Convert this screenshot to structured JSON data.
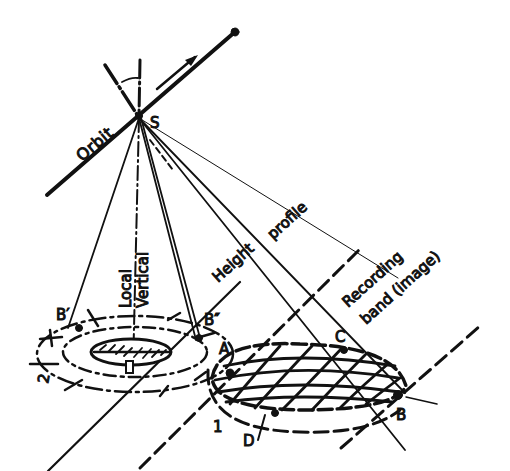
{
  "diagram": {
    "type": "satellite sensor geometry sketch",
    "colors": {
      "ink": "#111111",
      "background": "#ffffff"
    },
    "labels": {
      "orbit": "Orbit",
      "satellite": "S",
      "local_vertical_line1": "Local",
      "local_vertical_line2": "Vertical",
      "height_profile_1": "Height",
      "height_profile_2": "profile",
      "recording_band_1": "Recording",
      "recording_band_2": "band (image)",
      "point_b_prime": "B′",
      "point_b_double_prime": "B″",
      "point_a": "A",
      "point_b": "B",
      "point_c": "C",
      "point_d": "D",
      "region_1": "1",
      "region_2": "2"
    }
  }
}
